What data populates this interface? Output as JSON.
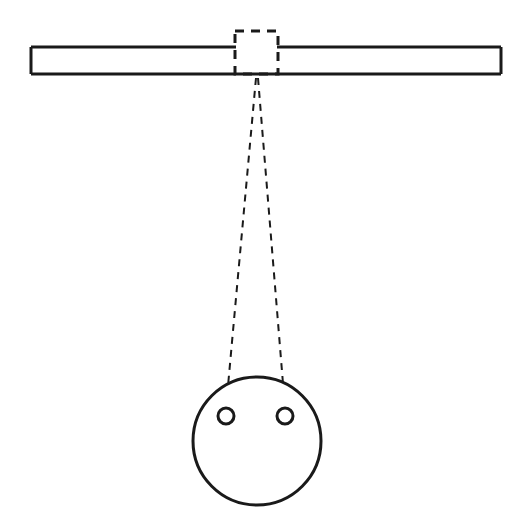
{
  "figure": {
    "background_color": "#ffffff",
    "line_color": "#1a1a1a",
    "canvas": {
      "width": 528,
      "height": 526
    }
  },
  "bar": {
    "name": "horizontal-bar",
    "left": 31,
    "right": 501,
    "top": 47,
    "bottom": 74,
    "stroke_width": 3,
    "fill": "#ffffff",
    "left_segment_end_x": 236,
    "right_segment_start_x": 277
  },
  "dashed_box": {
    "name": "dashed-inspection-window",
    "x": 235,
    "y": 31,
    "width": 43,
    "height": 43,
    "stroke_width": 3,
    "dash_pattern": "9 7"
  },
  "projection_lines": {
    "name": "dashed-projection-lines",
    "apex_x": 256,
    "apex_y": 78,
    "stroke_width": 2,
    "dash_pattern": "7 6",
    "left_line": {
      "x1": 256,
      "y1": 78,
      "x2": 226,
      "y2": 408
    },
    "right_line": {
      "x1": 258,
      "y1": 78,
      "x2": 285,
      "y2": 408
    }
  },
  "face_circle": {
    "name": "face-circle",
    "cx": 257,
    "cy": 441,
    "r": 64,
    "stroke_width": 3,
    "fill": "#ffffff"
  },
  "eyelets": [
    {
      "name": "left-eyelet",
      "cx": 226,
      "cy": 416,
      "r": 8,
      "stroke_width": 3
    },
    {
      "name": "right-eyelet",
      "cx": 285,
      "cy": 416,
      "r": 8,
      "stroke_width": 3
    }
  ],
  "labels": {
    "none_visible": ""
  }
}
